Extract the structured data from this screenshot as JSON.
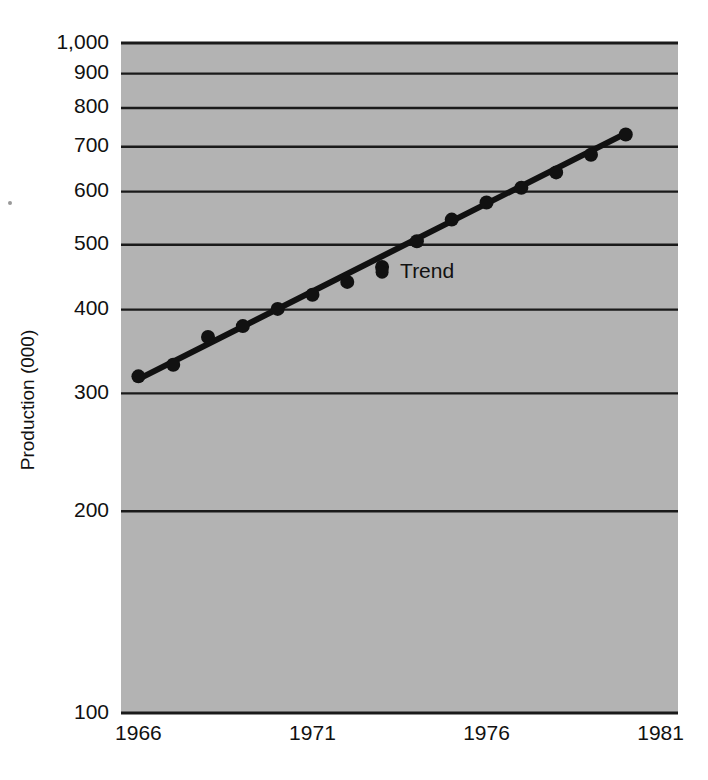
{
  "chart_data": {
    "type": "line",
    "title": "",
    "subtitle": "",
    "xlabel": "",
    "ylabel": "Production (000)",
    "yscale": "log",
    "xscale": "linear",
    "grid": true,
    "grid_axis": "y",
    "legend": "none",
    "xlim": [
      1965.5,
      1981.5
    ],
    "ylim": [
      100,
      1000
    ],
    "ytick_labels": [
      "1,000",
      "900",
      "800",
      "700",
      "600",
      "500",
      "400",
      "300",
      "200",
      "100"
    ],
    "ytick_values": [
      1000,
      900,
      800,
      700,
      600,
      500,
      400,
      300,
      200,
      100
    ],
    "xtick_labels": [
      "1966",
      "1971",
      "1976",
      "1981"
    ],
    "xtick_values": [
      1966,
      1971,
      1976,
      1981
    ],
    "x": [
      1966,
      1967,
      1968,
      1969,
      1970,
      1971,
      1972,
      1973,
      1974,
      1975,
      1976,
      1977,
      1978,
      1979,
      1980
    ],
    "values": [
      318,
      331,
      364,
      378,
      401,
      421,
      440,
      463,
      506,
      545,
      578,
      608,
      641,
      681,
      730
    ],
    "series": [
      {
        "name": "Production",
        "marker": "filled-circle",
        "values": [
          318,
          331,
          364,
          378,
          401,
          421,
          440,
          463,
          506,
          545,
          578,
          608,
          641,
          681,
          730
        ]
      },
      {
        "name": "Trend",
        "marker": "none",
        "line": "straight",
        "endpoints_x": [
          1966,
          1980
        ],
        "endpoints_y": [
          315,
          733
        ]
      }
    ],
    "annotations": [
      {
        "text": "Trend",
        "x": 1973.0,
        "y": 455
      }
    ],
    "colors": {
      "plot_background": "#b3b3b3",
      "grid_line": "#1a1a1a",
      "marker": "#111111",
      "trend_line": "#111111",
      "page_background": "#ffffff",
      "text": "#111111"
    }
  }
}
